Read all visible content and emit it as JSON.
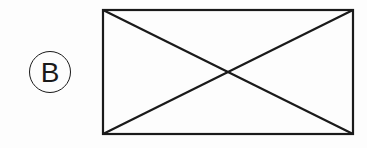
{
  "label": {
    "text": "B",
    "shape": "circle"
  },
  "figure": {
    "shape": "rectangle-with-diagonals",
    "rect": {
      "x": 103,
      "y": 10,
      "width": 250,
      "height": 124
    },
    "stroke_color": "#1a1a1a",
    "stroke_width": 2.2
  }
}
